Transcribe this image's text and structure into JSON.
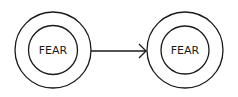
{
  "diagram": {
    "nodes": [
      {
        "id": "left",
        "label": "FEAR"
      },
      {
        "id": "right",
        "label": "FEAR"
      }
    ],
    "edges": [
      {
        "from": "left",
        "to": "right",
        "type": "arrow"
      }
    ],
    "stroke_color": "#1a1a1a",
    "background": "#ffffff"
  }
}
